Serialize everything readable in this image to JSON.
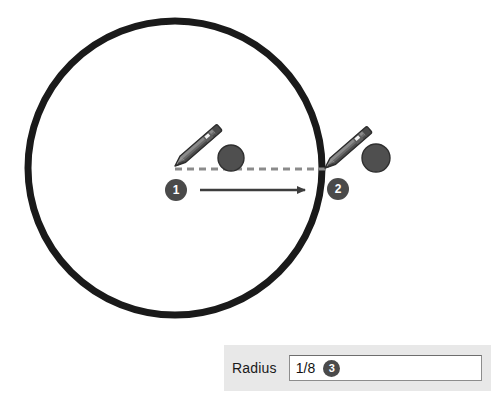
{
  "app": {
    "title": "Circle radius drag demonstration",
    "background_color": "#ffffff"
  },
  "colors": {
    "circle_stroke": "#1a1a1a",
    "dashed_guide": "#8b8b8b",
    "arrow": "#3d3d3d",
    "dot_fill": "#4f4f4f",
    "pencil_body": "#666666",
    "pencil_dark": "#3a3a3a",
    "badge_fill": "#4a4a4a",
    "badge_text": "#ffffff",
    "panel_bg": "#e8e8e8",
    "input_bg": "#ffffff",
    "input_border": "#8d8d8d",
    "label_text": "#1a1a1a"
  },
  "canvas": {
    "circle": {
      "label": "drawn-circle",
      "center_x": 175,
      "center_y": 168,
      "radius": 147,
      "stroke_width": 7
    },
    "guide_line": {
      "label": "dashed-radius-guide",
      "x1": 175,
      "y1": 169,
      "x2": 331,
      "y2": 169,
      "style": "dashed"
    },
    "drag_arrow": {
      "label": "drag-direction-arrow",
      "x1": 200,
      "y1": 190,
      "x2": 311,
      "y2": 190,
      "direction": "right"
    },
    "markers": [
      {
        "id": "step-1",
        "number": "1",
        "x": 176,
        "y": 190,
        "r": 11
      },
      {
        "id": "step-2",
        "number": "2",
        "x": 338,
        "y": 189,
        "r": 11
      }
    ],
    "handle_dots": [
      {
        "id": "handle-dot-start",
        "x": 231,
        "y": 158,
        "r": 13
      },
      {
        "id": "handle-dot-end",
        "x": 376,
        "y": 158,
        "r": 14
      }
    ],
    "pencils": [
      {
        "id": "pencil-start",
        "tip_x": 175,
        "tip_y": 166,
        "angle_deg": -41
      },
      {
        "id": "pencil-end",
        "tip_x": 325,
        "tip_y": 168,
        "angle_deg": -41
      }
    ]
  },
  "panel": {
    "name": "radius-control-panel",
    "field_label": "Radius",
    "field_value": "1/8",
    "field_placeholder": "",
    "step_number": "3"
  }
}
